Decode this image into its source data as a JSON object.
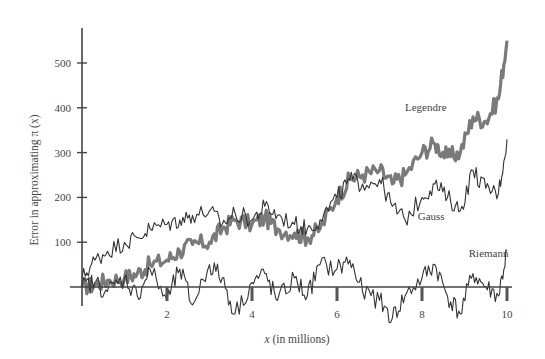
{
  "chart_data": {
    "type": "line",
    "title": "",
    "xlabel": "x (in millions)",
    "xlabel_var": "x",
    "xlabel_rest": " (in millions)",
    "ylabel": "Error in approximating π (x)",
    "xlim": [
      0,
      10
    ],
    "ylim": [
      -50,
      560
    ],
    "x_ticks": [
      2,
      4,
      6,
      8,
      10
    ],
    "y_ticks": [
      100,
      200,
      300,
      400,
      500
    ],
    "grid": false,
    "legend": "inline labels",
    "series": [
      {
        "name": "Legendre",
        "style": "thick",
        "color": "#7a7a7a",
        "label_pos": [
          7.6,
          392
        ],
        "x": [
          0,
          0.3,
          0.6,
          1.0,
          1.3,
          1.6,
          2.0,
          2.3,
          2.6,
          3.0,
          3.3,
          3.6,
          4.0,
          4.3,
          4.6,
          5.0,
          5.3,
          5.6,
          6.0,
          6.3,
          6.6,
          7.0,
          7.3,
          7.6,
          8.0,
          8.3,
          8.6,
          8.9,
          9.2,
          9.5,
          9.8,
          10.0
        ],
        "values": [
          0,
          5,
          15,
          20,
          30,
          50,
          60,
          80,
          95,
          100,
          130,
          150,
          140,
          155,
          130,
          120,
          110,
          130,
          200,
          240,
          250,
          260,
          230,
          250,
          300,
          320,
          290,
          300,
          380,
          370,
          420,
          550
        ]
      },
      {
        "name": "Gauss",
        "style": "thin",
        "color": "#333333",
        "label_pos": [
          7.9,
          150
        ],
        "x": [
          0,
          0.3,
          0.6,
          1.0,
          1.3,
          1.6,
          2.0,
          2.3,
          2.6,
          3.0,
          3.3,
          3.6,
          4.0,
          4.3,
          4.6,
          5.0,
          5.3,
          5.6,
          6.0,
          6.3,
          6.6,
          7.0,
          7.3,
          7.6,
          8.0,
          8.3,
          8.6,
          8.9,
          9.2,
          9.5,
          9.8,
          10.0
        ],
        "values": [
          20,
          60,
          80,
          100,
          110,
          130,
          140,
          150,
          160,
          170,
          140,
          165,
          150,
          180,
          160,
          140,
          130,
          150,
          200,
          240,
          230,
          240,
          180,
          150,
          200,
          230,
          200,
          170,
          260,
          220,
          210,
          330
        ]
      },
      {
        "name": "Riemann",
        "style": "thin",
        "color": "#333333",
        "label_pos": [
          9.1,
          68
        ],
        "x": [
          0,
          0.3,
          0.6,
          1.0,
          1.3,
          1.6,
          2.0,
          2.3,
          2.6,
          3.0,
          3.3,
          3.6,
          4.0,
          4.3,
          4.6,
          5.0,
          5.3,
          5.6,
          6.0,
          6.3,
          6.6,
          7.0,
          7.3,
          7.6,
          8.0,
          8.3,
          8.6,
          8.9,
          9.2,
          9.5,
          9.8,
          10.0
        ],
        "values": [
          0,
          10,
          -10,
          20,
          -20,
          40,
          -30,
          40,
          -40,
          50,
          20,
          -60,
          10,
          30,
          -30,
          20,
          -20,
          50,
          40,
          60,
          -10,
          -30,
          -70,
          -20,
          20,
          50,
          -20,
          -60,
          30,
          0,
          -20,
          80
        ]
      }
    ]
  }
}
